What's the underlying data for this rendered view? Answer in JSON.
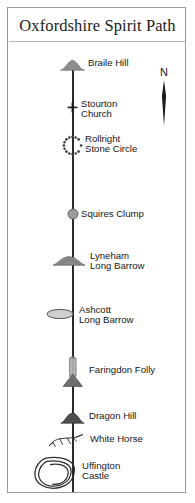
{
  "map": {
    "title": "Oxfordshire Spirit Path",
    "compass": {
      "label": "N",
      "icon": "north-arrow-needle"
    },
    "line_color": "#2a2a2a",
    "frame_color": "#9a9a9a",
    "sites": [
      {
        "name": "Braile Hill",
        "label": "Braile Hill",
        "icon": "hill-mound-icon",
        "icon_fill": "#8e8e8e"
      },
      {
        "name": "Stourton Church",
        "label": "Stourton\nChurch",
        "icon": "church-cross-icon",
        "icon_fill": "#161616"
      },
      {
        "name": "Rollright Stone Circle",
        "label": "Rollright\nStone Circle",
        "icon": "stone-circle-icon",
        "icon_fill": "#3a3a3a"
      },
      {
        "name": "Squires Clump",
        "label": "Squires Clump",
        "icon": "tree-clump-icon",
        "icon_fill": "#9b9b9b"
      },
      {
        "name": "Lyneham Long Barrow",
        "label": "Lyneham\nLong Barrow",
        "icon": "long-barrow-mound-icon",
        "icon_fill": "#8a8a8a"
      },
      {
        "name": "Ashcott Long Barrow",
        "label": "Ashcott\nLong Barrow",
        "icon": "long-barrow-oval-icon",
        "icon_fill": "#cfcfcf"
      },
      {
        "name": "Faringdon Folly",
        "label": "Faringdon Folly",
        "icon": "folly-tower-icon",
        "icon_fill": "#b4b4b4"
      },
      {
        "name": "Dragon Hill",
        "label": "Dragon Hill",
        "icon": "flat-top-hill-icon",
        "icon_fill": "#4d4d4d"
      },
      {
        "name": "White Horse",
        "label": "White Horse",
        "icon": "white-horse-figure-icon",
        "icon_fill": "#2e2e2e"
      },
      {
        "name": "Uffington Castle",
        "label": "Uffington\nCastle",
        "icon": "hillfort-rampart-icon",
        "icon_fill": "#2e2e2e"
      }
    ]
  }
}
